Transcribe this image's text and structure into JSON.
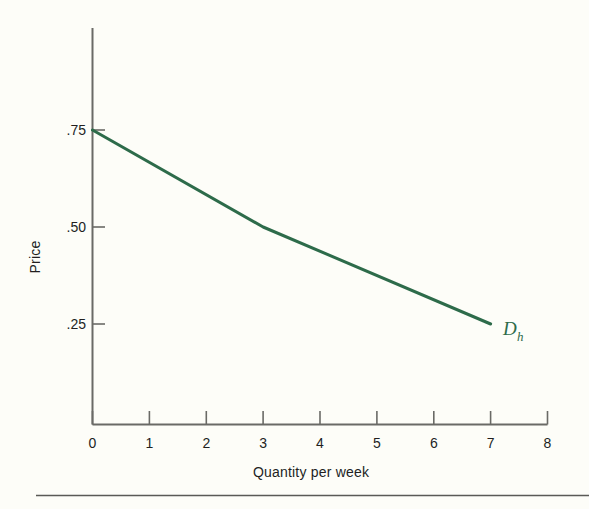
{
  "figure": {
    "background_color": "#fdfdf8",
    "rule_color": "#5a5a56"
  },
  "chart_data": {
    "type": "line",
    "title": "",
    "subtitle": "",
    "xlabel": "Quantity per week",
    "ylabel": "Price",
    "xlim": [
      0,
      8
    ],
    "ylim": [
      0,
      0.875
    ],
    "grid": false,
    "legend_position": "inline-right-end",
    "x_ticks": [
      0,
      1,
      2,
      3,
      4,
      5,
      6,
      7,
      8
    ],
    "x_tick_labels": [
      "0",
      "1",
      "2",
      "3",
      "4",
      "5",
      "6",
      "7",
      "8"
    ],
    "y_ticks": [
      0.25,
      0.5,
      0.75
    ],
    "y_tick_labels": [
      ".25",
      ".50",
      ".75"
    ],
    "series": [
      {
        "name": "D_h",
        "label_main": "D",
        "label_sub": "h",
        "color": "#2d6b4a",
        "line_width": 3,
        "x": [
          0,
          3,
          7
        ],
        "y": [
          0.75,
          0.5,
          0.25
        ]
      }
    ],
    "annotations": [
      {
        "name": "demand-curve-label",
        "text": "D",
        "subscript": "h",
        "x": 7.25,
        "y": 0.25
      }
    ]
  }
}
